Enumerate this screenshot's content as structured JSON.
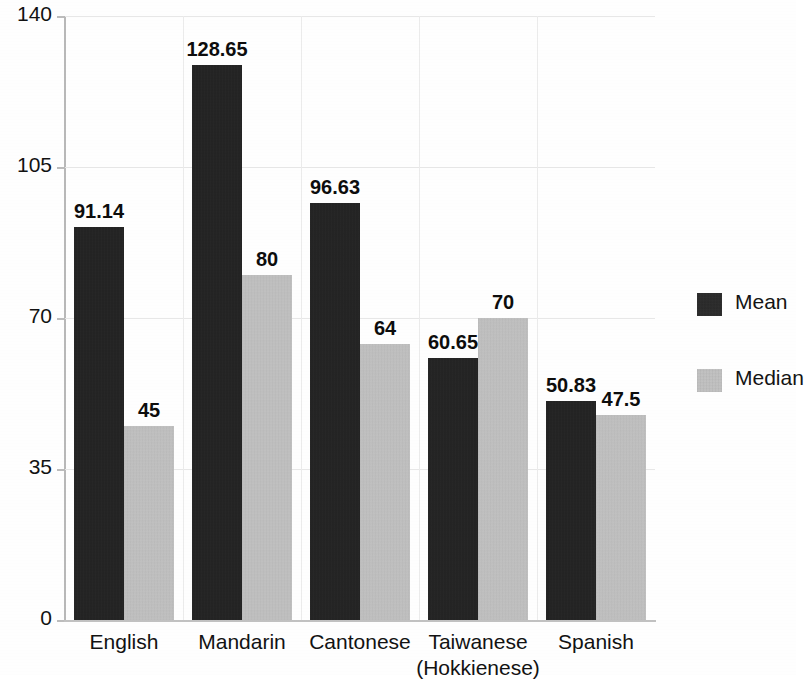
{
  "chart_data": {
    "type": "bar",
    "title": "",
    "subtitle": "",
    "xlabel": "",
    "ylabel": "",
    "grid": true,
    "legend_position": "right",
    "ylim": [
      0,
      140
    ],
    "yticks": [
      0,
      35,
      70,
      105,
      140
    ],
    "ytick_labels": [
      "0",
      "35",
      "70",
      "105",
      "140"
    ],
    "categories": [
      "English",
      "Mandarin",
      "Cantonese",
      "Taiwanese (Hokkienese)",
      "Spanish"
    ],
    "category_lines": [
      [
        "English"
      ],
      [
        "Mandarin"
      ],
      [
        "Cantonese"
      ],
      [
        "Taiwanese",
        "(Hokkienese)"
      ],
      [
        "Spanish"
      ]
    ],
    "series": [
      {
        "name": "Mean",
        "color": "#1a1a1a",
        "values": [
          91.14,
          128.65,
          96.63,
          60.65,
          50.83
        ],
        "value_labels": [
          "91.14",
          "128.65",
          "96.63",
          "60.65",
          "50.83"
        ]
      },
      {
        "name": "Median",
        "color": "#c6c6c6",
        "values": [
          45,
          80,
          64,
          70,
          47.5
        ],
        "value_labels": [
          "45",
          "80",
          "64",
          "70",
          "47.5"
        ]
      }
    ]
  },
  "legend": {
    "items": [
      {
        "label": "Mean",
        "swatch": "mean"
      },
      {
        "label": "Median",
        "swatch": "median"
      }
    ]
  }
}
